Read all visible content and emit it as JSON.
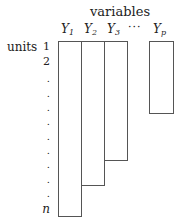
{
  "diagram": {
    "title": "variables",
    "units_label": "units",
    "variables": [
      {
        "name": "Y",
        "sub": "1"
      },
      {
        "name": "Y",
        "sub": "2"
      },
      {
        "name": "Y",
        "sub": "3"
      },
      {
        "name": "Y",
        "sub": "p"
      }
    ],
    "ellipsis": "···",
    "rows": {
      "first": "1",
      "second": "2",
      "dot": ".",
      "last": "n"
    }
  }
}
